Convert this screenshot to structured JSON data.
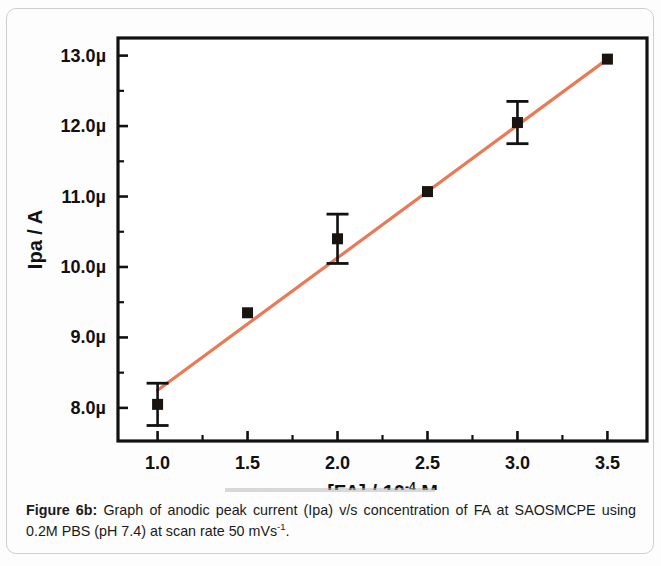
{
  "figure": {
    "caption_label": "Figure 6b:",
    "caption_text_1": " Graph of anodic peak current (Ipa) v/s concentration of FA at SAOSMCPE using 0.2M PBS (pH 7.4) at scan rate 50 mVs",
    "caption_sup": "-1",
    "caption_text_2": "."
  },
  "chart_data": {
    "type": "scatter",
    "title": "",
    "xlabel_prefix": "[FA] / 10",
    "xlabel_sup": "-4",
    "xlabel_suffix": " M",
    "ylabel": "Ipa / A",
    "x": [
      1.0,
      1.5,
      2.0,
      2.5,
      3.0,
      3.5
    ],
    "values": [
      8.05,
      9.35,
      10.4,
      11.07,
      12.05,
      12.95
    ],
    "yerr": [
      0.3,
      0.0,
      0.35,
      0.0,
      0.3,
      0.0
    ],
    "y_unit": "µ",
    "xlim": [
      0.78,
      3.72
    ],
    "ylim": [
      7.53,
      13.25
    ],
    "xticks": [
      "1.0",
      "1.5",
      "2.0",
      "2.5",
      "3.0",
      "3.5"
    ],
    "xtick_values": [
      1.0,
      1.5,
      2.0,
      2.5,
      3.0,
      3.5
    ],
    "yticks": [
      "8.0µ",
      "9.0µ",
      "10.0µ",
      "11.0µ",
      "12.0µ",
      "13.0µ"
    ],
    "ytick_values": [
      8.0,
      9.0,
      10.0,
      11.0,
      12.0,
      13.0
    ],
    "yminor_values": [
      8.5,
      9.5,
      10.5,
      11.5,
      12.5
    ],
    "xminor_values": [
      1.25,
      1.75,
      2.25,
      2.75,
      3.25
    ],
    "grid": false,
    "legend": null,
    "fit_line": {
      "name": "linear fit",
      "color": "#ea7a56",
      "x_start": 1.0,
      "y_start": 8.25,
      "x_end": 3.5,
      "y_end": 12.95
    },
    "marker": {
      "shape": "square",
      "color": "#1a1410",
      "size": 11
    }
  }
}
